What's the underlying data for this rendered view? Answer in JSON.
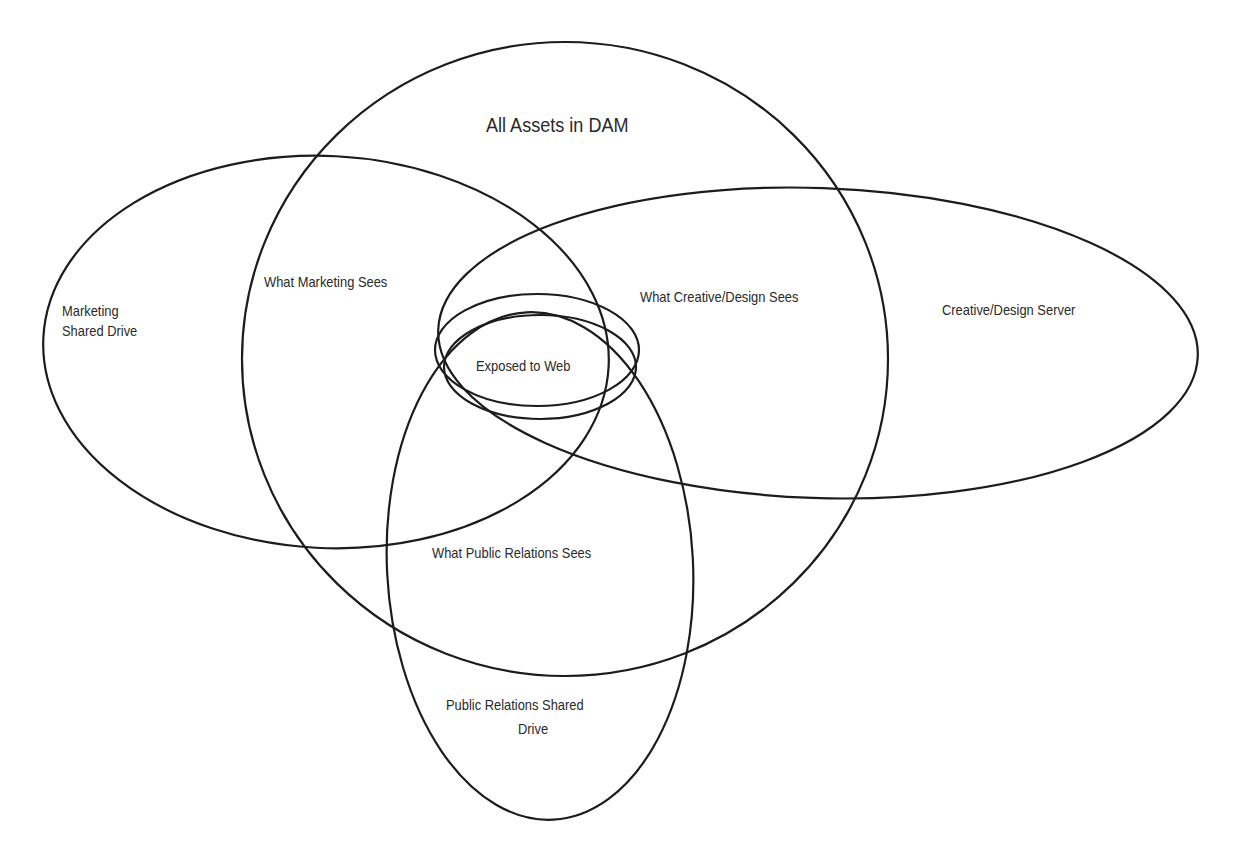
{
  "diagram": {
    "type": "venn",
    "title": "All Assets in DAM",
    "line_color": "#1c1c1c",
    "background": "#ffffff",
    "sets": [
      {
        "id": "dam",
        "label": "All Assets in DAM",
        "shape": "circle"
      },
      {
        "id": "marketing",
        "label": "Marketing Shared Drive",
        "shape": "ellipse"
      },
      {
        "id": "creative",
        "label": "Creative/Design Server",
        "shape": "ellipse"
      },
      {
        "id": "pr",
        "label": "Public Relations Shared Drive",
        "shape": "ellipse"
      },
      {
        "id": "web",
        "label": "Exposed to Web",
        "shape": "ellipse"
      }
    ],
    "labels": {
      "all_assets": "All Assets in DAM",
      "marketing_drive_line1": "Marketing",
      "marketing_drive_line2": "Shared Drive",
      "what_marketing_sees": "What Marketing Sees",
      "what_creative_sees": "What Creative/Design Sees",
      "creative_server": "Creative/Design Server",
      "exposed_to_web": "Exposed to Web",
      "what_pr_sees": "What Public Relations Sees",
      "pr_drive_line1": "Public Relations Shared",
      "pr_drive_line2": "Drive"
    }
  }
}
